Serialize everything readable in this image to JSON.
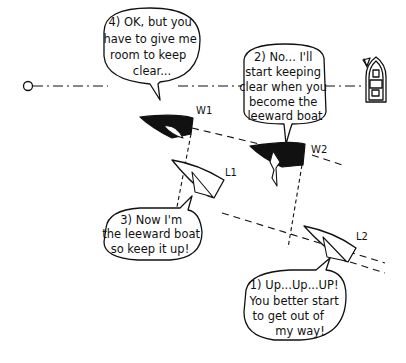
{
  "diagram": {
    "type": "sailing-rules-illustration",
    "start_line": {
      "left_marker": "pin-buoy",
      "right_marker": "committee-boat"
    },
    "boats": [
      {
        "id": "W1",
        "label": "W1",
        "color": "#111111",
        "role": "windward"
      },
      {
        "id": "W2",
        "label": "W2",
        "color": "#111111",
        "role": "windward"
      },
      {
        "id": "L1",
        "label": "L1",
        "color": "#ffffff",
        "role": "leeward"
      },
      {
        "id": "L2",
        "label": "L2",
        "color": "#ffffff",
        "role": "leeward"
      }
    ],
    "bubbles": [
      {
        "id": "b1",
        "number": "1)",
        "lines": [
          "1) Up...Up...UP!",
          "You better start",
          "to get out of",
          "my way!"
        ]
      },
      {
        "id": "b2",
        "number": "2)",
        "lines": [
          "2) No... I'll",
          "start keeping",
          "clear when you",
          "become the",
          "leeward boat"
        ]
      },
      {
        "id": "b3",
        "number": "3)",
        "lines": [
          "3) Now I'm",
          "the leeward boat",
          "so keep it up!"
        ]
      },
      {
        "id": "b4",
        "number": "4)",
        "lines": [
          "4) OK, but you",
          "have to give me",
          "room to keep",
          "clear..."
        ]
      }
    ]
  }
}
